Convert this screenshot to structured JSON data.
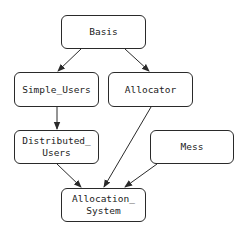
{
  "diagram": {
    "type": "dependency-graph",
    "nodes": [
      {
        "id": "basis",
        "lines": [
          "Basis"
        ],
        "x": 61,
        "y": 15,
        "w": 85,
        "h": 34
      },
      {
        "id": "simple_users",
        "lines": [
          "Simple_Users"
        ],
        "x": 14,
        "y": 72,
        "w": 85,
        "h": 35
      },
      {
        "id": "allocator",
        "lines": [
          "Allocator"
        ],
        "x": 108,
        "y": 72,
        "w": 85,
        "h": 35
      },
      {
        "id": "distributed_users",
        "lines": [
          "Distributed_",
          "Users"
        ],
        "x": 14,
        "y": 130,
        "w": 85,
        "h": 34
      },
      {
        "id": "mess",
        "lines": [
          "Mess"
        ],
        "x": 150,
        "y": 130,
        "w": 84,
        "h": 34
      },
      {
        "id": "allocation_system",
        "lines": [
          "Allocation_",
          "System"
        ],
        "x": 61,
        "y": 188,
        "w": 85,
        "h": 34
      }
    ],
    "edges": [
      {
        "from": "basis",
        "to": "simple_users"
      },
      {
        "from": "basis",
        "to": "allocator"
      },
      {
        "from": "simple_users",
        "to": "distributed_users"
      },
      {
        "from": "distributed_users",
        "to": "allocation_system"
      },
      {
        "from": "allocator",
        "to": "allocation_system"
      },
      {
        "from": "mess",
        "to": "allocation_system"
      }
    ],
    "colors": {
      "stroke": "#2a2a2a",
      "text": "#222222",
      "background": "#ffffff"
    }
  }
}
